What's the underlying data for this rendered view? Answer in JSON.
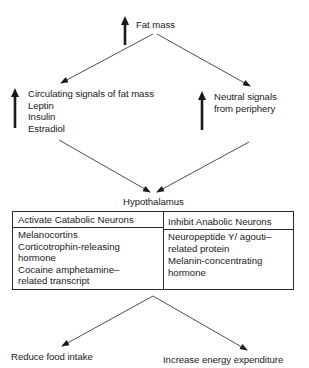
{
  "diagram": {
    "top": {
      "label": "Fat mass",
      "indicator": "up-arrow"
    },
    "left_branch": {
      "indicator": "up-arrow",
      "lines": [
        "Circulating signals of fat mass",
        "Leptin",
        "Insulin",
        "Estradiol"
      ]
    },
    "right_branch": {
      "indicator": "up-arrow",
      "lines": [
        "Neutral signals",
        "from periphery"
      ]
    },
    "center": {
      "label": "Hypothalamus"
    },
    "table": {
      "left": {
        "header": "Activate Catabolic Neurons",
        "items": [
          "Melanocortins",
          "Corticotrophin-releasing",
          "hormone",
          "Cocaine amphetamine–",
          "related transcript"
        ]
      },
      "right": {
        "header": "Inhibit Anabolic Neurons",
        "items": [
          "Neuropeptide Y/ agouti–",
          "related protein",
          "Melanin-concentrating",
          "hormone"
        ]
      }
    },
    "outcomes": {
      "left": "Reduce food intake",
      "right": "Increase energy expenditure"
    },
    "colors": {
      "ink": "#1a1a1a",
      "line": "#3a3a3a",
      "background": "#ffffff"
    }
  }
}
